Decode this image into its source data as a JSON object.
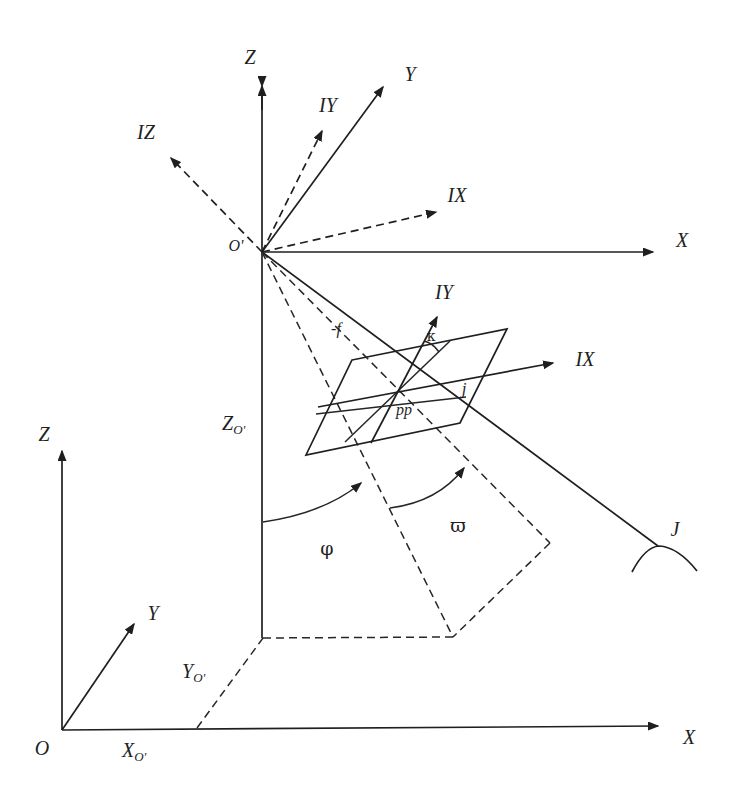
{
  "labels": {
    "upper": {
      "origin": "O'",
      "x": "X",
      "y": "Y",
      "z": "Z",
      "ix": "IX",
      "iy": "IY",
      "iz": "IZ"
    },
    "plane": {
      "ix": "IX",
      "iy": "IY",
      "principal_point": "pp",
      "image_point": "j",
      "focal": "-f",
      "kappa": "κ"
    },
    "angles": {
      "phi": "φ",
      "omega": "ϖ"
    },
    "ground": {
      "origin": "O",
      "x": "X",
      "y": "Y",
      "z": "Z",
      "ground_point": "J",
      "xo": {
        "base": "X",
        "sub": "O'"
      },
      "yo": {
        "base": "Y",
        "sub": "O'"
      },
      "zo": {
        "base": "Z",
        "sub": "O'"
      }
    }
  },
  "colors": {
    "ink": "#1f1f1f",
    "background": "#ffffff"
  }
}
